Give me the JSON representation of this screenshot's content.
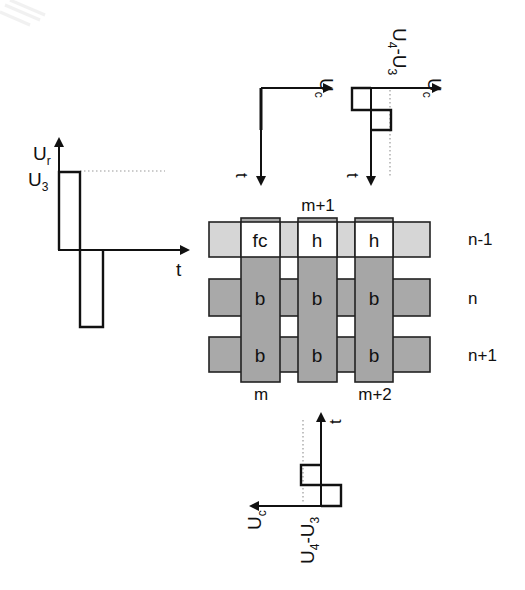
{
  "figure": {
    "colors": {
      "background": "#ffffff",
      "line": "#111111",
      "row_selected": "#d6d6d6",
      "row_unselected": "#a9a9a9",
      "column": "#a6a6a6",
      "half_selected_cell": "#ffffff",
      "dotted": "#999999"
    },
    "row_waveform": {
      "y_axis_label": "U",
      "y_axis_sub": "r",
      "level_label": "U",
      "level_sub": "3",
      "x_axis_label": "t"
    },
    "column_waveform_unselected": {
      "axis_label": "U",
      "axis_sub": "c",
      "time_label": "t"
    },
    "column_waveform_selected_top": {
      "axis_label": "U",
      "axis_sub": "c",
      "level_label_a": "U",
      "level_sub_a": "4",
      "level_dash": "-",
      "level_label_b": "U",
      "level_sub_b": "3",
      "time_label": "t"
    },
    "column_waveform_selected_bottom": {
      "axis_label": "U",
      "axis_sub": "c",
      "level_label_a": "U",
      "level_sub_a": "4",
      "level_dash": "-",
      "level_label_b": "U",
      "level_sub_b": "3",
      "time_label": "t"
    },
    "grid": {
      "column_labels": {
        "top": "m+1",
        "bottom_left": "m",
        "bottom_right": "m+2"
      },
      "row_labels": [
        "n-1",
        "n",
        "n+1"
      ],
      "cells": [
        [
          "fc",
          "h",
          "h"
        ],
        [
          "b",
          "b",
          "b"
        ],
        [
          "b",
          "b",
          "b"
        ]
      ]
    }
  }
}
